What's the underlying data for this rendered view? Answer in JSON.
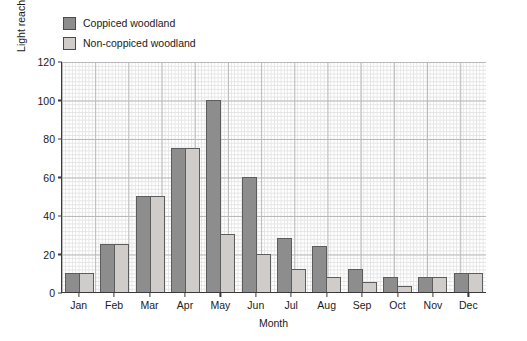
{
  "chart_data": {
    "type": "bar",
    "title": "",
    "subtitle": "",
    "xlabel": "Month",
    "ylabel": "Light reaching wood floor/arbitrary units",
    "categories": [
      "Jan",
      "Feb",
      "Mar",
      "Apr",
      "May",
      "Jun",
      "Jul",
      "Aug",
      "Sep",
      "Oct",
      "Nov",
      "Dec"
    ],
    "series": [
      {
        "name": "Coppiced woodland",
        "color": "#8d8d8d",
        "values": [
          10,
          25,
          50,
          75,
          100,
          60,
          28,
          24,
          12,
          8,
          8,
          10
        ]
      },
      {
        "name": "Non-coppiced woodland",
        "color": "#cfccc9",
        "values": [
          10,
          25,
          50,
          75,
          30,
          20,
          12,
          8,
          5,
          3,
          8,
          10
        ]
      }
    ],
    "ylim": [
      0,
      120
    ],
    "yticks": [
      0,
      20,
      40,
      60,
      80,
      100,
      120
    ],
    "ytick_labels": [
      "0",
      "20",
      "40",
      "60",
      "80",
      "100",
      "120"
    ],
    "grid": true,
    "grid_style": "fine graph-paper grid, minor and major lines",
    "legend_position": "above plot, top-left"
  },
  "legend": {
    "items": [
      {
        "label": "Coppiced woodland",
        "swatch": "series-dark"
      },
      {
        "label": "Non-coppiced woodland",
        "swatch": "series-light"
      }
    ]
  },
  "axes": {
    "y_title": "Light reaching wood floor/arbitrary units",
    "x_title": "Month"
  },
  "colors": {
    "series_dark": "#8d8d8d",
    "series_light": "#cfccc9",
    "bar_border": "#5c5c5c",
    "axis": "#3a3a3a",
    "grid_major": "#b9b9b9",
    "grid_minor": "#e4e4e4",
    "background": "#ffffff"
  }
}
